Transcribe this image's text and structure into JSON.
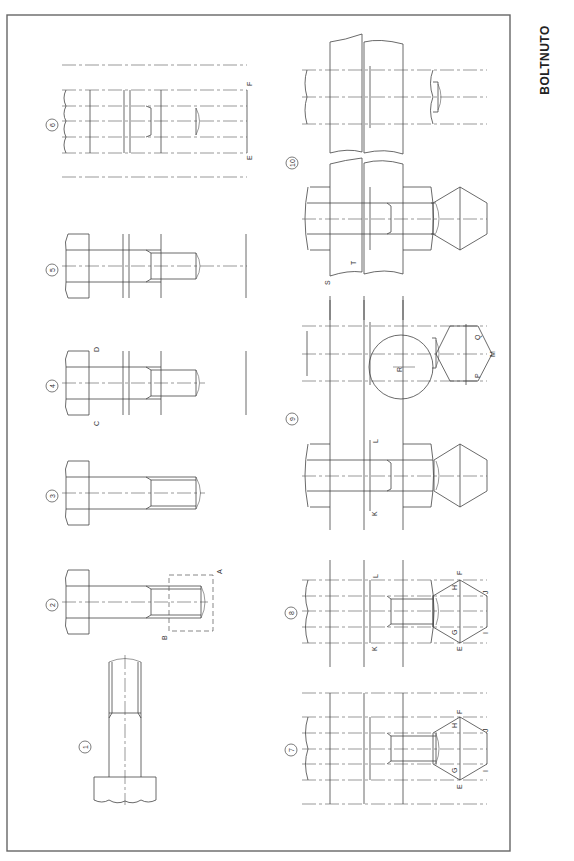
{
  "drawing": {
    "title": "BOLTNUTO",
    "type": "technical drawing sheet",
    "frame": {
      "x": 7,
      "y": 15,
      "width": 503,
      "height": 836,
      "stroke": "#555555"
    },
    "colors": {
      "line": "#444444",
      "background": "#ffffff"
    }
  },
  "figures": [
    {
      "number": "1",
      "label": "①",
      "letters": []
    },
    {
      "number": "2",
      "label": "②",
      "letters": [
        "A",
        "B"
      ]
    },
    {
      "number": "3",
      "label": "③",
      "letters": []
    },
    {
      "number": "4",
      "label": "④",
      "letters": [
        "C",
        "D"
      ]
    },
    {
      "number": "5",
      "label": "⑤",
      "letters": []
    },
    {
      "number": "6",
      "label": "⑥",
      "letters": [
        "E",
        "F"
      ]
    },
    {
      "number": "7",
      "label": "⑦",
      "letters": [
        "E",
        "F",
        "G",
        "H",
        "I",
        "J"
      ]
    },
    {
      "number": "8",
      "label": "⑧",
      "letters": [
        "K",
        "L",
        "E",
        "F",
        "G",
        "H",
        "I",
        "J"
      ]
    },
    {
      "number": "9",
      "label": "⑨",
      "letters": [
        "K",
        "L",
        "R",
        "P",
        "Q",
        "M"
      ]
    },
    {
      "number": "10",
      "label": "⑩",
      "letters": [
        "S",
        "T"
      ]
    }
  ],
  "labels": {
    "n1": "1",
    "n2": "2",
    "n3": "3",
    "n4": "4",
    "n5": "5",
    "n6": "6",
    "n7": "7",
    "n8": "8",
    "n9": "9",
    "n10": "10",
    "A": "A",
    "B": "B",
    "C": "C",
    "D": "D",
    "E": "E",
    "F": "F",
    "G": "G",
    "H": "H",
    "I": "I",
    "J": "J",
    "K": "K",
    "L": "L",
    "M": "M",
    "P": "P",
    "Q": "Q",
    "R": "R",
    "S": "S",
    "T": "T"
  }
}
